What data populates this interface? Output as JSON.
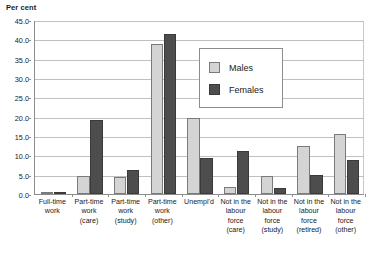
{
  "chart_data": {
    "type": "bar",
    "title": "",
    "subtitle": "",
    "ylabel": "Per cent",
    "xlabel": "",
    "ylim": [
      0,
      45
    ],
    "ytick_step": 5,
    "yticks": [
      "0.0",
      "5.0",
      "10.0",
      "15.0",
      "20.0",
      "25.0",
      "30.0",
      "35.0",
      "40.0",
      "45.0"
    ],
    "grid": true,
    "legend_position": "inside-top-right",
    "categories": [
      [
        "Full-time",
        "work"
      ],
      [
        "Part-time",
        "work",
        "(care)"
      ],
      [
        "Part-time",
        "work",
        "(study)"
      ],
      [
        "Part-time",
        "work",
        "(other)"
      ],
      [
        "Unempl'd"
      ],
      [
        "Not in the",
        "labour",
        "force",
        "(care)"
      ],
      [
        "Not in the",
        "labour",
        "force",
        "(study)"
      ],
      [
        "Not in the",
        "labour",
        "force",
        "(retired)"
      ],
      [
        "Not in the",
        "labour",
        "force",
        "(other)"
      ]
    ],
    "series": [
      {
        "name": "Males",
        "color": "#d4d4d4",
        "values": [
          0.1,
          4.7,
          4.3,
          38.7,
          19.6,
          1.9,
          4.7,
          12.4,
          15.5
        ]
      },
      {
        "name": "Females",
        "color": "#4d4d4d",
        "values": [
          0.1,
          19.2,
          6.2,
          41.3,
          9.2,
          11.2,
          1.5,
          5.0,
          8.7
        ]
      }
    ]
  }
}
